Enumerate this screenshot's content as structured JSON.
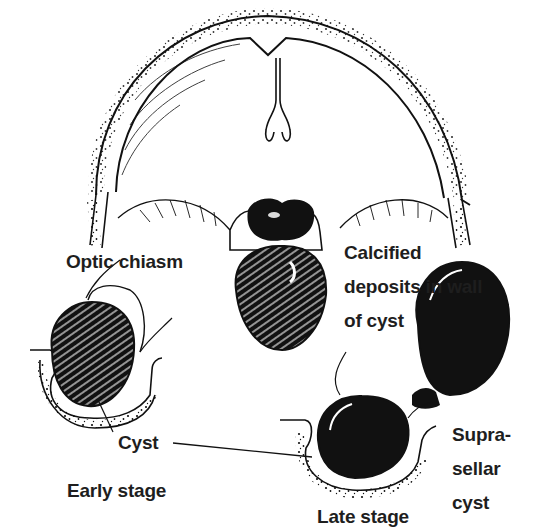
{
  "figure": {
    "colors": {
      "ink": "#111111",
      "paper": "#ffffff",
      "label": "#1e1e1e"
    }
  },
  "labels": {
    "optic_chiasm": "Optic chiasm",
    "calcified_deposits": "Calcified\ndeposits in wall\nof cyst",
    "cyst": "Cyst",
    "early_stage": "Early stage",
    "suprasellar_cyst": "Supra-\nsellar\ncyst",
    "late_stage": "Late stage"
  }
}
